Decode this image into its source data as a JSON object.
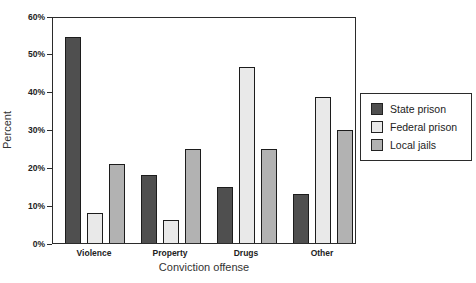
{
  "chart_data": {
    "type": "bar",
    "title": "",
    "xlabel": "Conviction offense",
    "ylabel": "Percent",
    "categories": [
      "Violence",
      "Property",
      "Drugs",
      "Other"
    ],
    "series": [
      {
        "name": "State prison",
        "color": "#4f4f4f",
        "values": [
          55,
          18,
          15,
          13
        ]
      },
      {
        "name": "Federal prison",
        "color": "#e9e9e9",
        "values": [
          8,
          6,
          47,
          39
        ]
      },
      {
        "name": "Local jails",
        "color": "#b2b2b2",
        "values": [
          21,
          25,
          25,
          30
        ]
      }
    ],
    "ylim": [
      0,
      60
    ],
    "ytick_step": 10,
    "ytick_format": "percent",
    "grid": false,
    "legend_position": "right",
    "axis_color": "#2b2b2b",
    "background_color": "#ffffff"
  }
}
